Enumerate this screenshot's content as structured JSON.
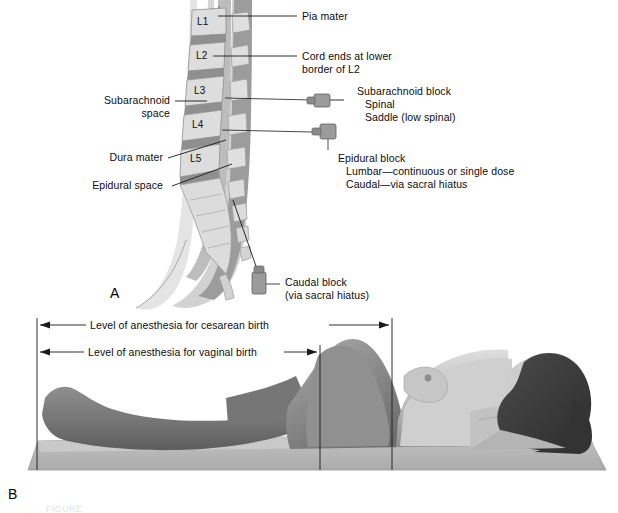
{
  "figure": {
    "title_partial": "FIGURE",
    "panel_a_letter": "A",
    "panel_b_letter": "B"
  },
  "panel_a": {
    "name": "spinal-anesthesia-sagittal-diagram",
    "vertebrae": [
      "L1",
      "L2",
      "L3",
      "L4",
      "L5"
    ],
    "labels_right": [
      {
        "id": "pia-mater",
        "text": "Pia mater"
      },
      {
        "id": "cord-ends",
        "line1": "Cord ends at lower",
        "line2": "border of L2"
      },
      {
        "id": "subarachnoid-block",
        "line1": "Subarachnoid block",
        "line2": "Spinal",
        "line3": "Saddle (low spinal)"
      },
      {
        "id": "epidural-block",
        "line1": "Epidural block",
        "line2": "Lumbar—continuous or single dose",
        "line3": "Caudal—via sacral hiatus"
      },
      {
        "id": "caudal-block",
        "line1": "Caudal block",
        "line2": "(via sacral hiatus)"
      }
    ],
    "labels_left": [
      {
        "id": "subarachnoid-space",
        "line1": "Subarachnoid",
        "line2": "space"
      },
      {
        "id": "dura-mater",
        "text": "Dura mater"
      },
      {
        "id": "epidural-space",
        "text": "Epidural space"
      }
    ]
  },
  "panel_b": {
    "name": "anesthesia-level-supine-figure",
    "measures": [
      {
        "id": "cesarean",
        "text": "Level of anesthesia for cesarean birth"
      },
      {
        "id": "vaginal",
        "text": "Level of anesthesia for vaginal birth"
      }
    ]
  },
  "colors": {
    "ink": "#1a1a1a",
    "bone_light": "#dcdcdc",
    "bone_mid": "#c3c3c3",
    "disc_dark": "#8d8d8d",
    "cord_gray": "#b4b4b4",
    "canal_dark": "#7e7e7e",
    "skin_light": "#d9d9d9",
    "skin_mid": "#a8a8a8",
    "body_dark": "#6e6e6e",
    "hair_dark": "#3c3c3c",
    "mat_gray": "#b9b9b9",
    "mat_dark": "#9a9a9a",
    "needle_gray": "#9b9b9b"
  }
}
